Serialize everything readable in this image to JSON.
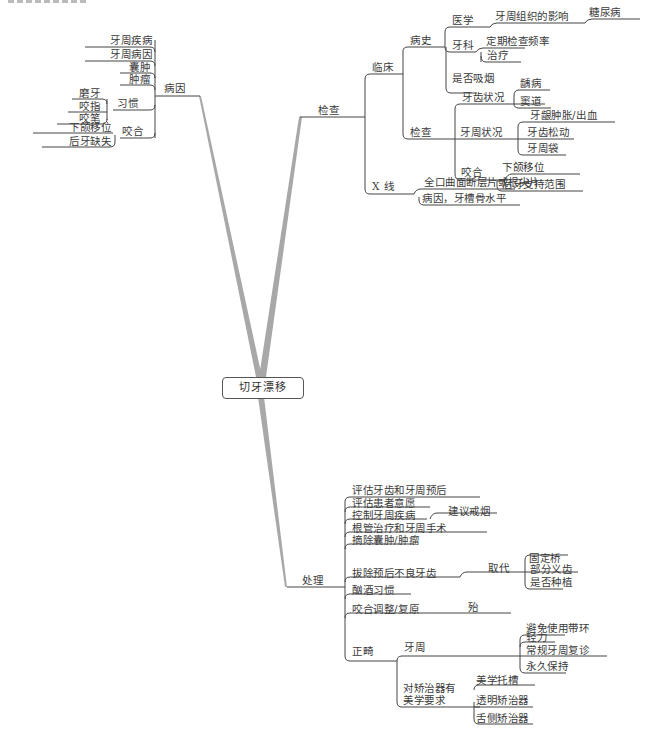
{
  "root": {
    "label": "切牙漂移"
  },
  "colors": {
    "line": "#444444",
    "trunk": "#a8a8a8",
    "text": "#3a3a3a"
  },
  "etiology": {
    "label": "病因",
    "items": [
      {
        "label": "牙周疾病"
      },
      {
        "label": "牙周病因"
      },
      {
        "label": "囊肿"
      },
      {
        "label": "肿瘤"
      },
      {
        "label": "习惯",
        "children": [
          {
            "label": "磨牙"
          },
          {
            "label": "咬指"
          },
          {
            "label": "咬笔"
          }
        ]
      },
      {
        "label": "咬合",
        "children": [
          {
            "label": "下颌移位"
          },
          {
            "label": "后牙缺失"
          }
        ]
      }
    ]
  },
  "exam": {
    "label": "检查",
    "clinical": {
      "label": "临床",
      "history": {
        "label": "病史",
        "medical": {
          "label": "医学",
          "child": "牙周组织的影响",
          "grandchild": "糖尿病"
        },
        "dental": {
          "label": "牙科",
          "children": [
            {
              "label": "定期检查频率"
            },
            {
              "label": "治疗"
            }
          ]
        },
        "smoking": {
          "label": "是否吸烟"
        }
      },
      "examination": {
        "label": "检查",
        "dental_status": {
          "label": "牙齿状况",
          "children": [
            {
              "label": "龋病"
            },
            {
              "label": "窦道"
            }
          ]
        },
        "perio_status": {
          "label": "牙周状况",
          "children": [
            {
              "label": "牙龈肿胀/出血"
            },
            {
              "label": "牙齿松动"
            },
            {
              "label": "牙周袋"
            }
          ]
        },
        "occlusion": {
          "label": "咬合",
          "children": [
            {
              "label": "下颌移位"
            },
            {
              "label": "后牙支持范围"
            }
          ]
        }
      }
    },
    "xray": {
      "label": "X 线",
      "children": [
        {
          "label": "全口曲面断层片或根尖片"
        },
        {
          "label": "病因，牙槽骨水平"
        }
      ]
    }
  },
  "treatment": {
    "label": "处理",
    "items": [
      {
        "label": "评估牙齿和牙周预后"
      },
      {
        "label": "评估患者意愿"
      },
      {
        "label": "控制牙周疾病",
        "child": "建议戒烟"
      },
      {
        "label": "根管治疗和牙周手术"
      },
      {
        "label": "摘除囊肿/肿瘤"
      },
      {
        "label": "拔除预后不良牙齿",
        "child": "取代",
        "grandchildren": [
          {
            "label": "固定桥"
          },
          {
            "label": "部分义齿"
          },
          {
            "label": "是否种植"
          }
        ]
      },
      {
        "label": "酗酒习惯"
      },
      {
        "label": "咬合调整/复原",
        "child": "殆"
      },
      {
        "label": "正畸",
        "perio": {
          "label": "牙周",
          "children": [
            {
              "label": "避免使用带环"
            },
            {
              "label": "轻力"
            },
            {
              "label": "常规牙周复诊"
            },
            {
              "label": "永久保持"
            }
          ]
        },
        "aesthetic": {
          "label": "对矫治器有\n美学要求",
          "line1": "对矫治器有",
          "line2": "美学要求",
          "children": [
            {
              "label": "美学托槽"
            },
            {
              "label": "透明矫治器"
            },
            {
              "label": "舌侧矫治器"
            }
          ]
        }
      }
    ]
  }
}
